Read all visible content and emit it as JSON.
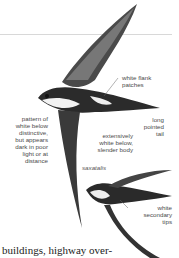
{
  "annotations": {
    "white_flank": "white flank patches",
    "white_flank_lines": [
      "white flank",
      "patches"
    ],
    "long_tail_lines": [
      "long",
      "pointed",
      "tail"
    ],
    "pattern_lines": [
      "pattern of",
      "white below",
      "distinctive,",
      "but appears",
      "dark in poor",
      "light or at",
      "distance"
    ],
    "extensive_lines": [
      "extensively",
      "white below,",
      "slender body"
    ],
    "subspecies": "saxatalis",
    "secondary_lines": [
      "white",
      "secondary",
      "tips"
    ]
  },
  "body_text": "buildings, highway over-"
}
